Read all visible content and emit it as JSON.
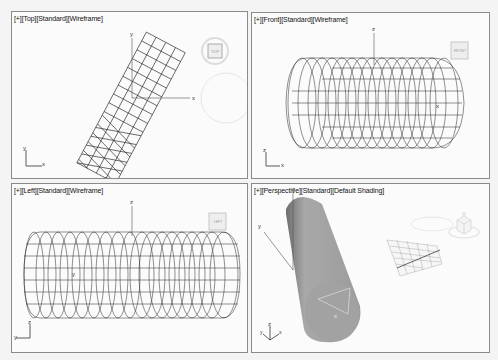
{
  "viewports": [
    {
      "id": "top",
      "label_parts": [
        "[+]",
        "[Top]",
        "[Standard]",
        "[Wireframe]"
      ],
      "viewcube_label": "TOP",
      "tripod_axes": [
        "y",
        "x"
      ],
      "world_axes": [
        "y",
        "x"
      ],
      "shading": "Wireframe"
    },
    {
      "id": "front",
      "label_parts": [
        "[+]",
        "[Front]",
        "[Standard]",
        "[Wireframe]"
      ],
      "viewcube_label": "FRONT",
      "tripod_axes": [
        "z",
        "x"
      ],
      "world_axes": [
        "z",
        "x"
      ],
      "shading": "Wireframe"
    },
    {
      "id": "left",
      "label_parts": [
        "[+]",
        "[Left]",
        "[Standard]",
        "[Wireframe]"
      ],
      "viewcube_label": "LEFT",
      "tripod_axes": [
        "z",
        "y"
      ],
      "world_axes": [
        "z",
        "y"
      ],
      "shading": "Wireframe"
    },
    {
      "id": "perspective",
      "label_parts": [
        "[+]",
        "[Perspective]",
        "[Standard]",
        "[Default Shading]"
      ],
      "viewcube_label": "",
      "tripod_axes": [
        "z",
        "y",
        "x"
      ],
      "world_axes": [
        "z",
        "y",
        "x"
      ],
      "shading": "Default Shading"
    }
  ],
  "colors": {
    "viewport_bg": "#fbfbfb",
    "border": "#8a8a8a",
    "wire": "#1a1a1a",
    "shaded_object": "#9a9a9a"
  }
}
